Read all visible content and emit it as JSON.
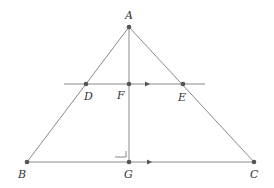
{
  "diagram": {
    "type": "geometry",
    "colors": {
      "line": "#8a8a8a",
      "point": "#555555",
      "label": "#333333",
      "background": "#ffffff"
    },
    "points": {
      "A": {
        "label": "A",
        "x": 129,
        "y": 27
      },
      "B": {
        "label": "B",
        "x": 27,
        "y": 162
      },
      "C": {
        "label": "C",
        "x": 254,
        "y": 162
      },
      "D": {
        "label": "D",
        "x": 86,
        "y": 84
      },
      "E": {
        "label": "E",
        "x": 183,
        "y": 84
      },
      "F": {
        "label": "F",
        "x": 129,
        "y": 84
      },
      "G": {
        "label": "G",
        "x": 129,
        "y": 162
      }
    },
    "segments": [
      "AB",
      "AC",
      "BC",
      "AG",
      "DE (extended line)"
    ],
    "annotations": {
      "right_angle": "at G between AG and BC",
      "parallel_arrows": [
        "on line DE",
        "on segment BC"
      ]
    }
  }
}
